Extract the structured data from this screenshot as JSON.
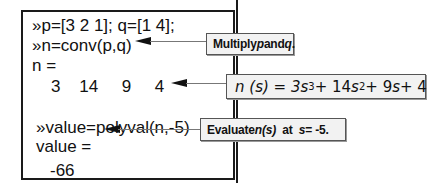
{
  "console": {
    "lines": [
      "»p=[3 2 1]; q=[1 4];",
      "»n=conv(p,q)",
      "n =",
      "    3    14     9     4",
      "»value=polyval(n,-5)",
      "value =",
      "-66"
    ]
  },
  "callouts": {
    "multiply": {
      "prefix": "Multiply ",
      "p": "p",
      "mid": " and ",
      "q": "q",
      "suffix": "."
    },
    "polynomial": {
      "lhs": "n (s) = 3",
      "s1": "s",
      "e3": "3",
      "t2": " + 14 ",
      "s2": "s",
      "e2": "2",
      "t3": " + 9 ",
      "s3": "s",
      "t4": " + 4"
    },
    "evaluate": {
      "prefix": "Evaluate ",
      "ns": "n(s)",
      "mid": "  at  ",
      "s": "s",
      "suffix": " = -5."
    }
  },
  "colors": {
    "border": "#1a1a1a",
    "callout_bg": "#f2f2f2",
    "leader": "#777777"
  }
}
